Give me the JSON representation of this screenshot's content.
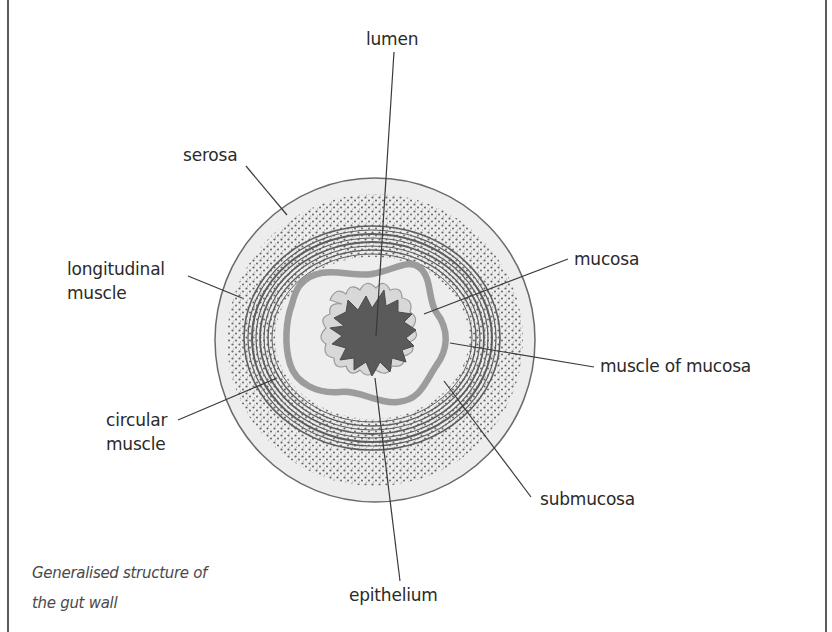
{
  "figure": {
    "caption_line1": "Generalised structure of",
    "caption_line2": "the gut wall"
  },
  "labels": {
    "lumen": "lumen",
    "serosa": "serosa",
    "longitudinal_muscle_line1": "longitudinal",
    "longitudinal_muscle_line2": "muscle",
    "circular_muscle_line1": "circular",
    "circular_muscle_line2": "muscle",
    "mucosa": "mucosa",
    "muscle_of_mucosa": "muscle of mucosa",
    "submucosa": "submucosa",
    "epithelium": "epithelium"
  },
  "colors": {
    "outline": "#6a6a6a",
    "serosa_fill": "#ececec",
    "stipple": "#555555",
    "muscle_lines": "#606060",
    "muscle_of_mucosa": "#9a9a9a",
    "lumen": "#5c5c5c",
    "epithelium": "#d6d6d6",
    "leader_lines": "#3a3a3a"
  }
}
